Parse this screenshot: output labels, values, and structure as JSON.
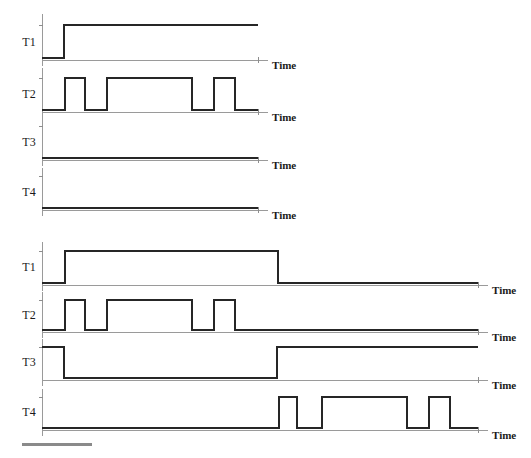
{
  "figure": {
    "title": "",
    "axis_label": "Time",
    "signal_names": [
      "T1",
      "T2",
      "T3",
      "T4"
    ]
  },
  "chart_data": {
    "type": "line",
    "title": "",
    "xlabel": "Time",
    "ylabel": "",
    "grid": false,
    "legend": "none",
    "panels": [
      {
        "name": "panel-top",
        "x_start": 42,
        "x_end": 258,
        "axis_end": 268,
        "signals": [
          {
            "name": "T1",
            "label": "T1",
            "low_y": 58,
            "high_y": 25,
            "axis_y": 60,
            "label_y": 43,
            "vert_top": 14,
            "transitions": [
              {
                "x": 42,
                "value": 0
              },
              {
                "x": 64,
                "value": 1
              },
              {
                "x": 258,
                "value": 1
              }
            ]
          },
          {
            "name": "T2",
            "label": "T2",
            "low_y": 110,
            "high_y": 78,
            "axis_y": 112,
            "label_y": 95,
            "vert_top": 68,
            "transitions": [
              {
                "x": 42,
                "value": 0
              },
              {
                "x": 65,
                "value": 1
              },
              {
                "x": 85,
                "value": 0
              },
              {
                "x": 107,
                "value": 1
              },
              {
                "x": 192,
                "value": 0
              },
              {
                "x": 214,
                "value": 1
              },
              {
                "x": 235,
                "value": 0
              },
              {
                "x": 258,
                "value": 0
              }
            ]
          },
          {
            "name": "T3",
            "label": "T3",
            "low_y": 158,
            "high_y": 126,
            "axis_y": 160,
            "label_y": 143,
            "vert_top": 118,
            "transitions": [
              {
                "x": 42,
                "value": 0
              },
              {
                "x": 258,
                "value": 0
              }
            ]
          },
          {
            "name": "T4",
            "label": "T4",
            "low_y": 208,
            "high_y": 176,
            "axis_y": 210,
            "label_y": 193,
            "vert_top": 168,
            "transitions": [
              {
                "x": 42,
                "value": 0
              },
              {
                "x": 258,
                "value": 0
              }
            ]
          }
        ]
      },
      {
        "name": "panel-bottom",
        "x_start": 42,
        "x_end": 478,
        "axis_end": 488,
        "signals": [
          {
            "name": "T1",
            "label": "T1",
            "low_y": 283,
            "high_y": 251,
            "axis_y": 285,
            "label_y": 268,
            "vert_top": 242,
            "transitions": [
              {
                "x": 42,
                "value": 0
              },
              {
                "x": 65,
                "value": 1
              },
              {
                "x": 278,
                "value": 0
              },
              {
                "x": 478,
                "value": 0
              }
            ]
          },
          {
            "name": "T2",
            "label": "T2",
            "low_y": 330,
            "high_y": 300,
            "axis_y": 332,
            "label_y": 316,
            "vert_top": 292,
            "transitions": [
              {
                "x": 42,
                "value": 0
              },
              {
                "x": 65,
                "value": 1
              },
              {
                "x": 85,
                "value": 0
              },
              {
                "x": 107,
                "value": 1
              },
              {
                "x": 192,
                "value": 0
              },
              {
                "x": 214,
                "value": 1
              },
              {
                "x": 235,
                "value": 0
              },
              {
                "x": 478,
                "value": 0
              }
            ]
          },
          {
            "name": "T3",
            "label": "T3",
            "low_y": 378,
            "high_y": 347,
            "axis_y": 380,
            "label_y": 363,
            "vert_top": 339,
            "transitions": [
              {
                "x": 42,
                "value": 1
              },
              {
                "x": 64,
                "value": 0
              },
              {
                "x": 277,
                "value": 1
              },
              {
                "x": 478,
                "value": 1
              }
            ]
          },
          {
            "name": "T4",
            "label": "T4",
            "low_y": 428,
            "high_y": 397,
            "axis_y": 430,
            "label_y": 413,
            "vert_top": 389,
            "transitions": [
              {
                "x": 42,
                "value": 0
              },
              {
                "x": 279,
                "value": 1
              },
              {
                "x": 297,
                "value": 0
              },
              {
                "x": 322,
                "value": 1
              },
              {
                "x": 407,
                "value": 0
              },
              {
                "x": 429,
                "value": 1
              },
              {
                "x": 450,
                "value": 0
              },
              {
                "x": 478,
                "value": 0
              }
            ]
          }
        ]
      }
    ]
  },
  "scale_bar": {
    "name": "scale-bar",
    "x": 22,
    "y": 443,
    "width": 70,
    "height": 3,
    "color": "#8a8a8a"
  },
  "colors": {
    "waveform": "#262626",
    "axis": "#9a9a9a",
    "text": "#1a1a1a",
    "background": "#ffffff"
  }
}
